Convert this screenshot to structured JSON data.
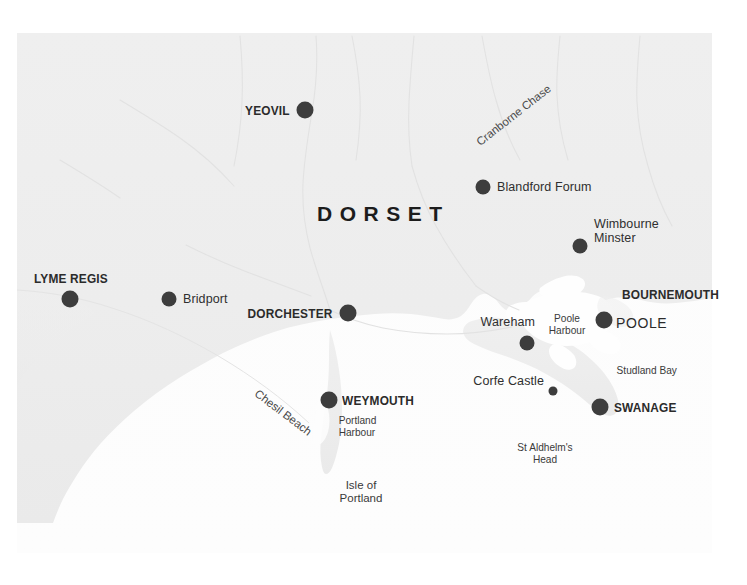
{
  "map": {
    "title": "Dorset",
    "colors": {
      "land": "#eeeeee",
      "sea": "#fdfdfd",
      "page": "#ffffff",
      "marker": "#3d3d3d",
      "label": "#2b2b2b",
      "river": "#e0e0e0",
      "feature_text": "#3a3a3a"
    },
    "county_label": "DORSET",
    "markers": [
      {
        "id": "yeovil",
        "label": "YEOVIL",
        "style": "major",
        "size": "lg",
        "x": 305,
        "y": 110,
        "label_x": 289,
        "label_y": 110,
        "align": "right"
      },
      {
        "id": "blandford-forum",
        "label": "Blandford Forum",
        "style": "minor",
        "size": "md",
        "x": 483,
        "y": 187,
        "label_x": 497,
        "label_y": 187,
        "align": "left"
      },
      {
        "id": "wimbourne-minster",
        "label": "Wimbourne\nMinster",
        "style": "minor",
        "size": "md",
        "x": 580,
        "y": 246,
        "label_x": 594,
        "label_y": 238,
        "align": "left"
      },
      {
        "id": "lyme-regis",
        "label": "LYME REGIS",
        "style": "major",
        "size": "lg",
        "x": 70,
        "y": 299,
        "label_x": 35,
        "label_y": 279,
        "align": "left"
      },
      {
        "id": "bridport",
        "label": "Bridport",
        "style": "minor",
        "size": "md",
        "x": 169,
        "y": 299,
        "label_x": 183,
        "label_y": 299,
        "align": "left"
      },
      {
        "id": "dorchester",
        "label": "DORCHESTER",
        "style": "major",
        "size": "lg",
        "x": 348,
        "y": 313,
        "label_x": 334,
        "label_y": 313,
        "align": "right"
      },
      {
        "id": "poole",
        "label": "POOLE",
        "style": "poole",
        "size": "lg",
        "x": 604,
        "y": 320,
        "label_x": 617,
        "label_y": 325,
        "align": "left"
      },
      {
        "id": "wareham",
        "label": "Wareham",
        "style": "minor",
        "size": "md",
        "x": 527,
        "y": 343,
        "label_x": 512,
        "label_y": 322,
        "align": "right"
      },
      {
        "id": "corfe-castle",
        "label": "Corfe Castle",
        "style": "minor",
        "size": "sm",
        "x": 553,
        "y": 391,
        "label_x": 541,
        "label_y": 381,
        "align": "right"
      },
      {
        "id": "weymouth",
        "label": "WEYMOUTH",
        "style": "major",
        "size": "lg",
        "x": 329,
        "y": 400,
        "label_x": 343,
        "label_y": 400,
        "align": "left"
      },
      {
        "id": "swanage",
        "label": "SWANAGE",
        "style": "major",
        "size": "lg",
        "x": 600,
        "y": 407,
        "label_x": 614,
        "label_y": 407,
        "align": "left"
      }
    ],
    "area_labels": [
      {
        "id": "bournemouth",
        "text": "BOURNEMOUTH",
        "x": 623,
        "y": 294,
        "style": "major",
        "align": "left"
      },
      {
        "id": "poole-harbour",
        "text": "Poole\nHarbour",
        "x": 566,
        "y": 320,
        "style": "feature",
        "align": "center"
      },
      {
        "id": "studland-bay",
        "text": "Studland Bay",
        "x": 615,
        "y": 370,
        "style": "feature",
        "align": "left"
      },
      {
        "id": "portland-harbour",
        "text": "Portland\nHarbour",
        "x": 337,
        "y": 420,
        "style": "feature",
        "align": "left"
      },
      {
        "id": "isle-of-portland",
        "text": "Isle of\nPortland",
        "x": 360,
        "y": 485,
        "style": "feature-wide",
        "align": "center"
      },
      {
        "id": "st-aldhelms-head",
        "text": "St Aldhelm's\nHead",
        "x": 545,
        "y": 447,
        "style": "feature",
        "align": "center"
      }
    ],
    "rotated_labels": [
      {
        "id": "cranborne-chase",
        "text": "Cranborne Chase",
        "x": 478,
        "y": 137,
        "rotate": -38
      },
      {
        "id": "chesil-beach",
        "text": "Chesil Beach",
        "x": 258,
        "y": 389,
        "rotate": 37
      }
    ]
  }
}
